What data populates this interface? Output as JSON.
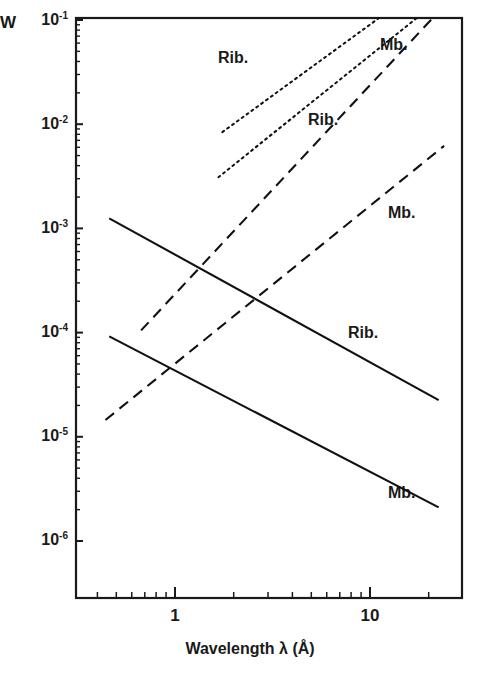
{
  "chart_data": {
    "type": "line",
    "title": "",
    "xlabel": "Wavelength λ (Å)",
    "ylabel": "W",
    "xscale": "log",
    "yscale": "log",
    "xlim": [
      0.38,
      28
    ],
    "ylim": [
      1e-06,
      0.1
    ],
    "grid": false,
    "legend_position": "inline-curve-labels",
    "xtick_labels": [
      "1",
      "10"
    ],
    "xtick_values": [
      1,
      10
    ],
    "ytick_labels": [
      "10⁻¹",
      "10⁻²",
      "10⁻³",
      "10⁻⁴",
      "10⁻⁵",
      "10⁻⁶"
    ],
    "ytick_mantissas": [
      "10",
      "10",
      "10",
      "10",
      "10",
      "10"
    ],
    "ytick_exponents": [
      "-1",
      "-2",
      "-3",
      "-4",
      "-5",
      "-6"
    ],
    "ytick_values": [
      0.1,
      0.01,
      0.001,
      0.0001,
      1e-05,
      1e-06
    ],
    "series": [
      {
        "name": "Rib.",
        "label": "Rib.",
        "style": "dotted",
        "color": "#111111",
        "x": [
          1.75,
          27.0
        ],
        "y": [
          0.0084,
          0.35
        ],
        "label_x": 2.0,
        "label_y": 0.031
      },
      {
        "name": "Mb.",
        "label": "Mb.",
        "style": "dotted",
        "color": "#111111",
        "x": [
          1.67,
          18.5
        ],
        "y": [
          0.0031,
          0.115
        ],
        "label_x": 8.2,
        "label_y": 0.048
      },
      {
        "name": "Rib.",
        "label": "Rib.",
        "style": "dashed",
        "color": "#111111",
        "x": [
          0.67,
          22.0
        ],
        "y": [
          0.000105,
          0.115
        ],
        "label_x": 3.6,
        "label_y": 0.0082
      },
      {
        "name": "Mb.",
        "label": "Mb.",
        "style": "dashed",
        "color": "#111111",
        "x": [
          0.44,
          24.0
        ],
        "y": [
          1.45e-05,
          0.0062
        ],
        "label_x": 9.3,
        "label_y": 0.00125
      },
      {
        "name": "Rib.",
        "label": "Rib.",
        "style": "solid",
        "color": "#111111",
        "x": [
          0.46,
          22.5
        ],
        "y": [
          0.00125,
          2.25e-05
        ],
        "label_x": 8.3,
        "label_y": 9.2e-05
      },
      {
        "name": "Mb.",
        "label": "Mb.",
        "style": "solid",
        "color": "#111111",
        "x": [
          0.46,
          22.5
        ],
        "y": [
          9.2e-05,
          2.1e-06
        ],
        "label_x": 9.8,
        "label_y": 4.4e-06
      }
    ]
  },
  "axes": {
    "y_unit_label": "W",
    "x_title": "Wavelength λ (Å)"
  }
}
